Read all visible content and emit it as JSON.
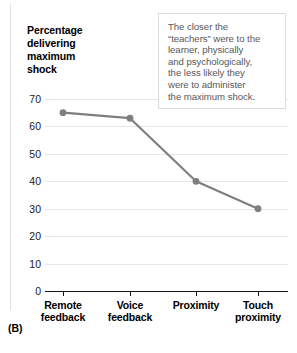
{
  "panel": {
    "label": "(B)"
  },
  "chart_data": {
    "type": "line",
    "title": "Percentage delivering maximum shock",
    "title_lines": [
      "Percentage",
      "delivering",
      "maximum",
      "shock"
    ],
    "xlabel": "",
    "ylabel": "Percentage delivering maximum shock",
    "categories": [
      "Remote feedback",
      "Voice feedback",
      "Proximity",
      "Touch proximity"
    ],
    "category_lines": [
      [
        "Remote",
        "feedback"
      ],
      [
        "Voice",
        "feedback"
      ],
      [
        "Proximity",
        ""
      ],
      [
        "Touch",
        "proximity"
      ]
    ],
    "values": [
      65,
      63,
      40,
      30
    ],
    "ylim": [
      0,
      70
    ],
    "ytick_labels": [
      "70",
      "60",
      "50",
      "40",
      "30",
      "20",
      "10",
      "0"
    ],
    "ytick_values": [
      70,
      60,
      50,
      40,
      30,
      20,
      10,
      0
    ],
    "grid": true,
    "legend": "none",
    "series_color": "#7f7f83",
    "marker_color": "#7f7f83",
    "gridline_color": "#e6e6e6",
    "axis_color": "#111111",
    "annotation": {
      "text": "The closer the “teachers” were to the learner, physically and psychologically, the less likely they were to administer the maximum shock.",
      "lines": [
        "The closer the",
        "“teachers” were to the",
        "learner, physically",
        "and psychologically,",
        "the less likely they",
        "were to administer",
        "the maximum shock."
      ],
      "text_color": "#58585a",
      "border_color": "#dcdcdc"
    }
  }
}
